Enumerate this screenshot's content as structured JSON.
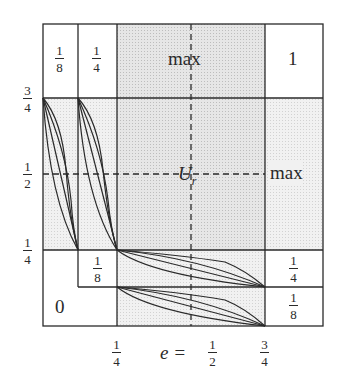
{
  "diagram": {
    "cells": {
      "top_col1": "1/8",
      "top_col2": "1/4",
      "top_middle": "max",
      "top_right": "1",
      "center": "U_r",
      "right_middle": "max",
      "right_lower1": "1/4",
      "right_lower2": "1/8",
      "left_lower_inner": "1/8",
      "left_bottom": "0"
    },
    "y_axis_ticks": [
      {
        "num": "3",
        "den": "4"
      },
      {
        "num": "1",
        "den": "2"
      },
      {
        "num": "1",
        "den": "4"
      }
    ],
    "x_axis_ticks": [
      {
        "num": "1",
        "den": "4"
      },
      {
        "num": "1",
        "den": "2"
      },
      {
        "num": "3",
        "den": "4"
      }
    ],
    "x_axis_label": "e =",
    "center_label_main": "U",
    "center_label_sub": "r",
    "colors": {
      "line": "#2a2a2a",
      "shade_light": "#ececec",
      "shade_dark": "#d9d9d9",
      "white": "#ffffff"
    }
  }
}
